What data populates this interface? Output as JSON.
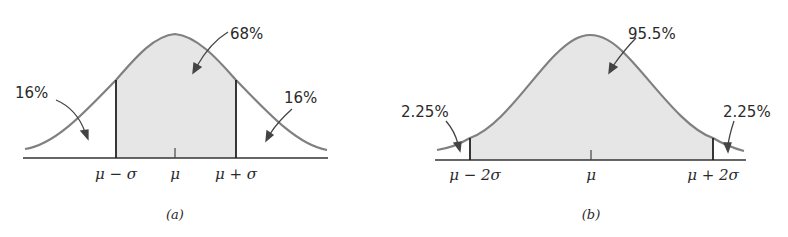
{
  "figure": {
    "panel_a": {
      "caption": "(a)",
      "center_label": "68%",
      "left_tail_label": "16%",
      "right_tail_label": "16%",
      "axis_labels": [
        "μ − σ",
        "μ",
        "μ + σ"
      ]
    },
    "panel_b": {
      "caption": "(b)",
      "center_label": "95.5%",
      "left_tail_label": "2.25%",
      "right_tail_label": "2.25%",
      "axis_labels": [
        "μ − 2σ",
        "μ",
        "μ + 2σ"
      ]
    },
    "colors": {
      "curve": "#808080",
      "shade": "#e6e6e6",
      "axis": "#333333",
      "text": "#2a2a2a"
    }
  }
}
